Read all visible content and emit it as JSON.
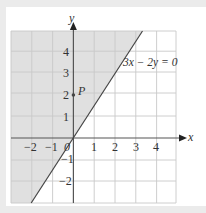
{
  "figure": {
    "x_axis_label": "x",
    "y_axis_label": "y",
    "origin_label": "0",
    "x_tick_labels": [
      "−2",
      "−1",
      "1",
      "2",
      "3",
      "4"
    ],
    "y_tick_labels": [
      "4",
      "3",
      "2",
      "1",
      "−1",
      "−2"
    ],
    "point": {
      "label": "P",
      "x": 0,
      "y": 2
    },
    "line_equation": "3x − 2y = 0",
    "shaded_region": "3x − 2y < 0 (left of line)",
    "colors": {
      "background": "#ebebeb",
      "shade": "#e0e0e0",
      "grid": "#c8c8c8",
      "axis": "#555555",
      "line": "#444444"
    }
  }
}
